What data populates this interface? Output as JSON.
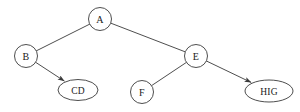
{
  "diagram": {
    "type": "tree",
    "canvas": {
      "width": 300,
      "height": 112,
      "background": "#ffffff"
    },
    "style": {
      "stroke_color": "#3a3a3a",
      "node_fill": "#ffffff",
      "text_color": "#1a1a1a",
      "stroke_width": 0.9
    },
    "nodes": [
      {
        "id": "A",
        "label": "A",
        "shape": "circle",
        "cx": 100,
        "cy": 19,
        "rx": 11.5,
        "ry": 11.5,
        "level": 0,
        "wide": false
      },
      {
        "id": "B",
        "label": "B",
        "shape": "circle",
        "cx": 26,
        "cy": 56,
        "rx": 11.5,
        "ry": 11.5,
        "level": 1,
        "wide": false
      },
      {
        "id": "E",
        "label": "E",
        "shape": "circle",
        "cx": 196,
        "cy": 56,
        "rx": 11.5,
        "ry": 11.5,
        "level": 1,
        "wide": false
      },
      {
        "id": "CD",
        "label": "CD",
        "shape": "ellipse",
        "cx": 78,
        "cy": 90,
        "rx": 20,
        "ry": 10.5,
        "level": 2,
        "wide": true
      },
      {
        "id": "F",
        "label": "F",
        "shape": "circle",
        "cx": 142,
        "cy": 92,
        "rx": 11.5,
        "ry": 11.5,
        "level": 2,
        "wide": false
      },
      {
        "id": "HIG",
        "label": "HIG",
        "shape": "ellipse",
        "cx": 269,
        "cy": 91,
        "rx": 24,
        "ry": 11,
        "level": 2,
        "wide": true
      }
    ],
    "edges": [
      {
        "id": "A-B",
        "from": "A",
        "to": "B",
        "arrow": false
      },
      {
        "id": "A-E",
        "from": "A",
        "to": "E",
        "arrow": false
      },
      {
        "id": "B-CD",
        "from": "B",
        "to": "CD",
        "arrow": true
      },
      {
        "id": "E-F",
        "from": "E",
        "to": "F",
        "arrow": false
      },
      {
        "id": "E-HIG",
        "from": "E",
        "to": "HIG",
        "arrow": true
      }
    ]
  }
}
